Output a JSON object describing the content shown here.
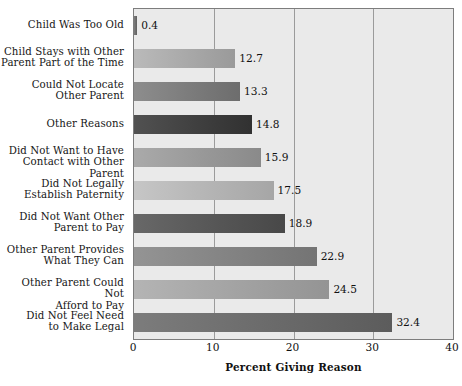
{
  "chart_data": {
    "type": "bar",
    "orientation": "horizontal",
    "title": "",
    "xlabel": "Percent Giving Reason",
    "ylabel": "",
    "xlim": [
      0,
      40
    ],
    "xticks": [
      0,
      10,
      20,
      30,
      40
    ],
    "grid": true,
    "legend": false,
    "categories": [
      "Child Was Too Old",
      "Child Stays with Other\nParent Part of the Time",
      "Could Not Locate\nOther Parent",
      "Other Reasons",
      "Did Not Want to Have\nContact with Other Parent",
      "Did Not Legally\nEstablish Paternity",
      "Did Not Want Other\nParent to Pay",
      "Other Parent Provides\nWhat They Can",
      "Other Parent Could Not\nAfford to Pay",
      "Did Not Feel Need\nto Make Legal"
    ],
    "values": [
      0.4,
      12.7,
      13.3,
      14.8,
      15.9,
      17.5,
      18.9,
      22.9,
      24.5,
      32.4
    ],
    "value_labels": [
      "0.4",
      "12.7",
      "13.3",
      "14.8",
      "15.9",
      "17.5",
      "18.9",
      "22.9",
      "24.5",
      "32.4"
    ],
    "bar_colors": [
      "#6e6e6e",
      "#a8a8a8",
      "#7b7b7b",
      "#3f3f3f",
      "#989898",
      "#b4b4b4",
      "#565656",
      "#828282",
      "#a2a2a2",
      "#6a6a6a"
    ],
    "plot_background": "#eaeaea",
    "gridline_color": "#9b9b9b",
    "axis_color": "#7d7d7d"
  },
  "axis": {
    "tick_labels": [
      "0",
      "10",
      "20",
      "30",
      "40"
    ],
    "title": "Percent Giving Reason"
  }
}
